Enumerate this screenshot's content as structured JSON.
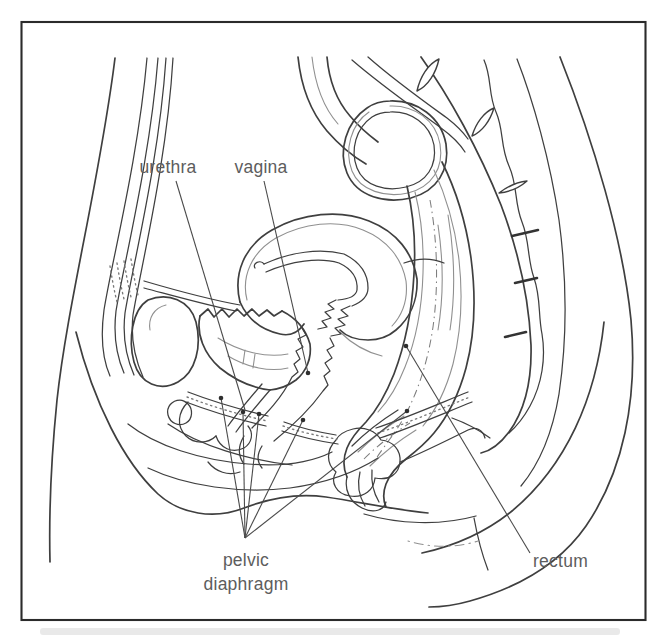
{
  "figure": {
    "labels": {
      "urethra": "urethra",
      "vagina": "vagina",
      "pelvic_line1": "pelvic",
      "pelvic_line2": "diaphragm",
      "rectum": "rectum"
    },
    "colors": {
      "ink": "#3f3f3f",
      "light-ink": "#909090",
      "label-text": "#5d5d5d",
      "leader": "#4a4a4a",
      "frame": "#2b2b2b",
      "background": "#ffffff"
    }
  }
}
